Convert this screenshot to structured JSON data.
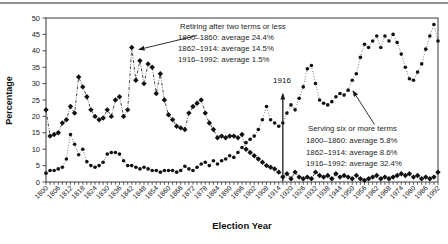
{
  "axes": {
    "y_title": "Percentage",
    "x_title": "Election Year"
  },
  "annotations": {
    "retiring_legend": {
      "title": "Retiring after two terms or less",
      "line1": "1800–1860: average 24.4%",
      "line2": "1862–1914: average 14.5%",
      "line3": "1916–1992: average 1.5%"
    },
    "serving_legend": {
      "title": "Serving six or more terms",
      "line1": "1800–1860: average 5.8%",
      "line2": "1862–1914: average 8.6%",
      "line3": "1916–1992: average 32.4%"
    },
    "year_marker_label": "1916"
  },
  "chart_data": {
    "type": "line",
    "title": "",
    "xlabel": "Election Year",
    "ylabel": "Percentage",
    "xlim": [
      1800,
      1992
    ],
    "ylim": [
      0,
      50
    ],
    "yticks": [
      0,
      5,
      10,
      15,
      20,
      25,
      30,
      35,
      40,
      45,
      50
    ],
    "x_tick_step_years": 2,
    "x_label_step_years": 6,
    "grid": false,
    "legend_position": "annotated-with-arrows",
    "x": [
      1800,
      1802,
      1804,
      1806,
      1808,
      1810,
      1812,
      1814,
      1816,
      1818,
      1820,
      1822,
      1824,
      1826,
      1828,
      1830,
      1832,
      1834,
      1836,
      1838,
      1840,
      1842,
      1844,
      1846,
      1848,
      1850,
      1852,
      1854,
      1856,
      1858,
      1860,
      1862,
      1864,
      1866,
      1868,
      1870,
      1872,
      1874,
      1876,
      1878,
      1880,
      1882,
      1884,
      1886,
      1888,
      1890,
      1892,
      1894,
      1896,
      1898,
      1900,
      1902,
      1904,
      1906,
      1908,
      1910,
      1912,
      1914,
      1916,
      1918,
      1920,
      1922,
      1924,
      1926,
      1928,
      1930,
      1932,
      1934,
      1936,
      1938,
      1940,
      1942,
      1944,
      1946,
      1948,
      1950,
      1952,
      1954,
      1956,
      1958,
      1960,
      1962,
      1964,
      1966,
      1968,
      1970,
      1972,
      1974,
      1976,
      1978,
      1980,
      1982,
      1984,
      1986,
      1988,
      1990,
      1992
    ],
    "series": [
      {
        "name": "Retiring after two terms or less",
        "marker": "diamond",
        "line_style": "dash-dot",
        "averages": {
          "1800-1860": "24.4%",
          "1862-1914": "14.5%",
          "1916-1992": "1.5%"
        },
        "values": [
          22,
          14,
          14.5,
          15,
          18,
          19,
          23,
          21,
          32,
          29,
          26,
          22,
          20,
          19,
          19.5,
          22,
          20,
          25,
          26,
          20,
          22,
          41,
          31,
          37,
          30,
          36,
          35,
          27,
          33,
          25,
          20.5,
          19,
          17,
          16.5,
          16,
          21,
          23,
          24,
          25,
          21,
          18,
          16,
          13.5,
          14,
          13.5,
          14,
          14,
          13.5,
          14.5,
          10,
          9,
          8,
          7,
          6,
          5,
          4.5,
          4,
          3,
          1.5,
          2.5,
          1,
          3,
          1.5,
          1,
          1.5,
          1,
          3,
          2,
          1.5,
          2,
          1,
          2.5,
          1.5,
          2,
          1.5,
          1,
          2,
          1,
          0.5,
          1,
          1.5,
          2,
          1,
          1.5,
          1,
          1.5,
          2,
          2.5,
          2,
          2.5,
          1.5,
          2,
          1,
          1.5,
          1,
          1.5,
          3
        ]
      },
      {
        "name": "Serving six or more terms",
        "marker": "circle",
        "line_style": "dotted",
        "averages": {
          "1800-1860": "5.8%",
          "1862-1914": "8.6%",
          "1916-1992": "32.4%"
        },
        "values": [
          2.7,
          3.5,
          3.5,
          4,
          4.5,
          7,
          14.5,
          11.5,
          8.3,
          10,
          6.2,
          5,
          4.5,
          5,
          6,
          8.5,
          9,
          9,
          8.5,
          6.5,
          5,
          5,
          4.5,
          4,
          4.5,
          4,
          3.5,
          3.5,
          3,
          3.5,
          3.5,
          3.5,
          3,
          3.5,
          4.8,
          4,
          3.5,
          4.5,
          5.5,
          6,
          5,
          6.5,
          5.5,
          6.5,
          7,
          8,
          7.5,
          9,
          10.5,
          12,
          13,
          14,
          16,
          19,
          23,
          19,
          18,
          17,
          18,
          21,
          23.5,
          22,
          25.5,
          29,
          34.5,
          35.5,
          30,
          25,
          24,
          23.5,
          24.5,
          26,
          27,
          26.5,
          28,
          31,
          33,
          38,
          42,
          41,
          43,
          44.5,
          41,
          44.5,
          43,
          45,
          42.5,
          39,
          35,
          31.5,
          31,
          33.5,
          36,
          40.5,
          44.5,
          48,
          43
        ]
      }
    ],
    "colors": {
      "ink": "#1a1a1a",
      "frame": "#3a3a3a",
      "top_rule": "#919191",
      "background": "#ffffff"
    }
  }
}
